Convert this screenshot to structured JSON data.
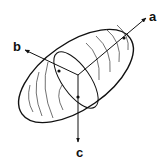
{
  "diagram": {
    "type": "ellipsoid-axes",
    "stroke_color": "#111111",
    "background": "#ffffff",
    "axes": [
      {
        "name": "a",
        "label": "a"
      },
      {
        "name": "b",
        "label": "b"
      },
      {
        "name": "c",
        "label": "c"
      }
    ]
  }
}
